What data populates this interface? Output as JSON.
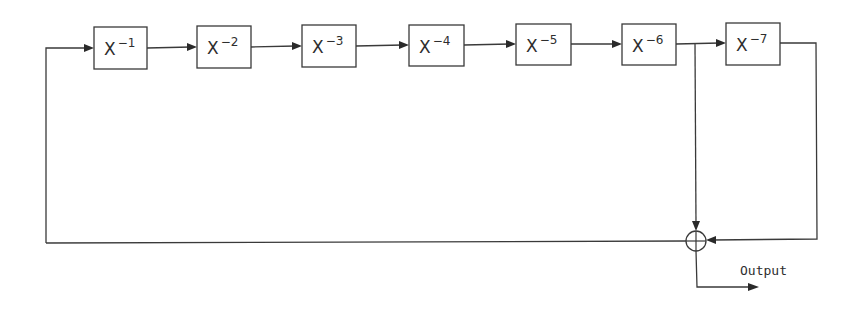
{
  "diagram": {
    "type": "shift-register feedback block diagram",
    "delay_blocks": [
      {
        "id": "d1",
        "base": "X",
        "exponent": "−1",
        "x": 94,
        "y": 27,
        "w": 53,
        "h": 42
      },
      {
        "id": "d2",
        "base": "X",
        "exponent": "−2",
        "x": 197,
        "y": 26,
        "w": 54,
        "h": 42
      },
      {
        "id": "d3",
        "base": "X",
        "exponent": "−3",
        "x": 302,
        "y": 25,
        "w": 54,
        "h": 42
      },
      {
        "id": "d4",
        "base": "X",
        "exponent": "−4",
        "x": 409,
        "y": 25,
        "w": 55,
        "h": 41
      },
      {
        "id": "d5",
        "base": "X",
        "exponent": "−5",
        "x": 516,
        "y": 24,
        "w": 55,
        "h": 41
      },
      {
        "id": "d6",
        "base": "X",
        "exponent": "−6",
        "x": 622,
        "y": 24,
        "w": 54,
        "h": 41
      },
      {
        "id": "d7",
        "base": "X",
        "exponent": "−7",
        "x": 726,
        "y": 23,
        "w": 54,
        "h": 42
      }
    ],
    "summer": {
      "symbol": "⊕",
      "cx": 696,
      "cy": 241,
      "r": 10
    },
    "output_label": "Output",
    "connections": [
      "feedback → X^-1",
      "X^-1 → X^-2",
      "X^-2 → X^-3",
      "X^-3 → X^-4",
      "X^-4 → X^-5",
      "X^-5 → X^-6",
      "X^-6 → X^-7",
      "X^-6 tap → summer",
      "X^-7 → summer",
      "summer → feedback",
      "summer → Output"
    ],
    "colors": {
      "line": "#3a3a3a",
      "background": "#ffffff"
    }
  }
}
